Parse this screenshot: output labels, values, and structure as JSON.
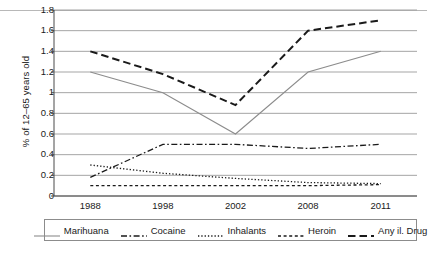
{
  "chart_data": {
    "type": "line",
    "title": "",
    "subtitle": "",
    "xlabel": "",
    "ylabel": "% of 12–65 years old",
    "categories": [
      "1988",
      "1998",
      "2002",
      "2008",
      "2011"
    ],
    "x": [
      1988,
      1998,
      2002,
      2008,
      2011
    ],
    "ylim": [
      0,
      1.8
    ],
    "ytick_values": [
      0,
      0.2,
      0.4,
      0.6,
      0.8,
      1,
      1.2,
      1.4,
      1.6,
      1.8
    ],
    "ytick_labels": [
      "0",
      "0.2",
      "0.4",
      "0.6",
      "0.8",
      "1",
      "1.2",
      "1.4",
      "1.6",
      "1.8"
    ],
    "grid": "horizontal",
    "legend_position": "bottom",
    "series": [
      {
        "name": "Marihuana",
        "values": [
          1.2,
          1.0,
          0.6,
          1.2,
          1.4
        ],
        "style": "solid",
        "color": "#8c8c8c"
      },
      {
        "name": "Cocaine",
        "values": [
          0.18,
          0.5,
          0.5,
          0.46,
          0.5
        ],
        "style": "dash-dot",
        "color": "#1a1a1a"
      },
      {
        "name": "Inhalants",
        "values": [
          0.3,
          0.22,
          0.17,
          0.13,
          0.12
        ],
        "style": "dotted",
        "color": "#1a1a1a"
      },
      {
        "name": "Heroin",
        "values": [
          0.1,
          0.1,
          0.1,
          0.1,
          0.11
        ],
        "style": "short-dash",
        "color": "#1a1a1a"
      },
      {
        "name": "Any il. Drug",
        "values": [
          1.4,
          1.18,
          0.88,
          1.6,
          1.7
        ],
        "style": "long-dash",
        "color": "#1a1a1a"
      }
    ]
  },
  "axis": {
    "y_title": "% of 12–65 years old"
  },
  "legend": {
    "entries": [
      {
        "label": "Marihuana"
      },
      {
        "label": "Cocaine"
      },
      {
        "label": "Inhalants"
      },
      {
        "label": "Heroin"
      },
      {
        "label": "Any il. Drug"
      }
    ]
  },
  "caption": {
    "text": ""
  },
  "colors": {
    "grid": "#9b9b9b",
    "axis": "#4a4a4a",
    "marihuana": "#8c8c8c",
    "dark": "#1a1a1a"
  }
}
